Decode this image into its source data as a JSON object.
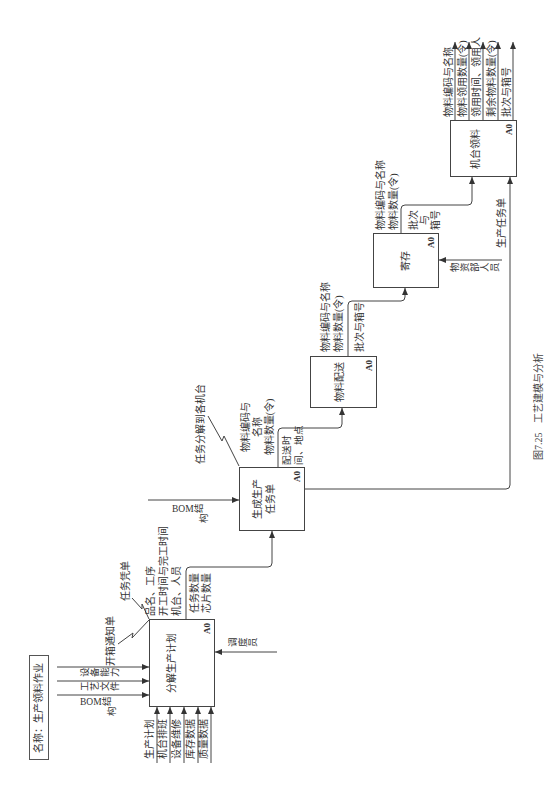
{
  "figure": {
    "name_box": "名称：生产领料作业",
    "caption_number": "图7.25",
    "caption_title": "工艺建模与分析"
  },
  "colors": {
    "line": "#444444",
    "text": "#333333",
    "background": "#ffffff"
  },
  "activities": [
    {
      "title": [
        "分解生产计划"
      ],
      "node": "A0",
      "inputs": [
        "生产计划",
        "机台排班",
        "设备维修",
        "库存数据",
        "质量数据"
      ],
      "controls": [
        "设备能力",
        "工艺文件",
        "BOM结构"
      ],
      "mechanisms": [
        "调度员"
      ],
      "outputs_above": [
        "品名、工序",
        "开工时间与完工时间",
        "机台、人员"
      ],
      "outputs_below": [
        "任务数量",
        "芯片数量"
      ],
      "callouts": [
        "开箱通知单",
        "任务凭单"
      ]
    },
    {
      "title": [
        "生成生产",
        "任务单"
      ],
      "node": "A0",
      "controls": [
        "BOM结构"
      ],
      "outputs_above": [
        "物料编码与",
        "名称",
        "物料数量(令)"
      ],
      "outputs_below": [
        "配送时",
        "间、地点"
      ],
      "callouts": [
        "任务分解到各机台"
      ],
      "side_output": "生产任务单"
    },
    {
      "title": [
        "物料配送"
      ],
      "node": "A0",
      "outputs_above": [
        "物料编码与名称",
        "物料数量(令)"
      ],
      "outputs_below": [
        "批次与箱号"
      ]
    },
    {
      "title": [
        "寄存"
      ],
      "node": "A0",
      "mechanisms": [
        "物资部人员"
      ],
      "outputs_above": [
        "物料编码与名称",
        "物料数量(令)"
      ],
      "outputs_below": [
        "批次",
        "与",
        "箱号"
      ]
    },
    {
      "title": [
        "机台领料"
      ],
      "node": "A0",
      "outputs": [
        "物料编码与名称",
        "物料领用数量(令)",
        "领用时间、领用人",
        "剩余物料数量(令)",
        "批次与箱号"
      ]
    }
  ]
}
